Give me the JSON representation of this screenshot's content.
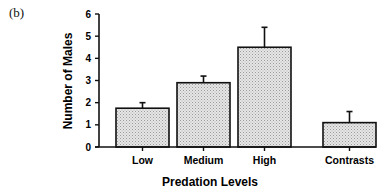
{
  "panel_label": "(b)",
  "chart_data": {
    "type": "bar",
    "title": "",
    "xlabel": "Predation Levels",
    "ylabel": "Number of Males",
    "categories": [
      "Low",
      "Medium",
      "High",
      "Contrasts"
    ],
    "values": [
      1.75,
      2.9,
      4.5,
      1.1
    ],
    "error_upper": [
      2.0,
      3.2,
      5.4,
      1.6
    ],
    "ylim": [
      0,
      6
    ],
    "yticks": [
      0,
      1,
      2,
      3,
      4,
      5,
      6
    ],
    "grid": false,
    "legend": null,
    "bar_fill": "#d9d9d9",
    "bar_edge": "#111111"
  }
}
